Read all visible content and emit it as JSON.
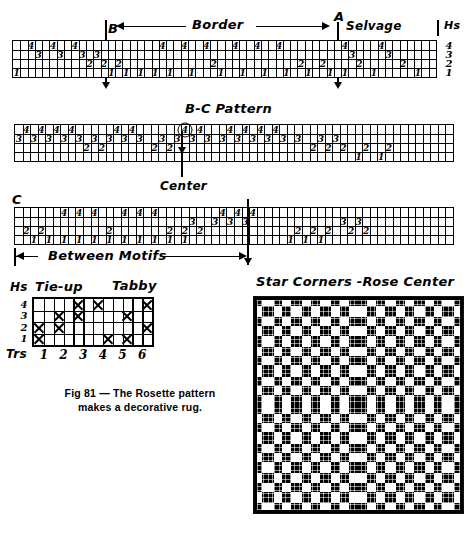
{
  "figure": {
    "caption_line1": "Fig 81 — The Rosette pattern",
    "caption_line2": "makes a decorative rug."
  },
  "draft1": {
    "label_B": "B",
    "label_A": "A",
    "label_border": "Border",
    "label_selvage": "Selvage",
    "label_hs_right": "Hs",
    "harness_labels": [
      "4",
      "3",
      "2",
      "1"
    ],
    "columns": 58,
    "threads": [
      {
        "col": 0,
        "harness": 1
      },
      {
        "col": 2,
        "harness": 4
      },
      {
        "col": 3,
        "harness": 3
      },
      {
        "col": 5,
        "harness": 4
      },
      {
        "col": 6,
        "harness": 3
      },
      {
        "col": 8,
        "harness": 4
      },
      {
        "col": 9,
        "harness": 3
      },
      {
        "col": 10,
        "harness": 2
      },
      {
        "col": 11,
        "harness": 3
      },
      {
        "col": 12,
        "harness": 2
      },
      {
        "col": 13,
        "harness": 1
      },
      {
        "col": 14,
        "harness": 2
      },
      {
        "col": 15,
        "harness": 1
      },
      {
        "col": 17,
        "harness": 1
      },
      {
        "col": 19,
        "harness": 1
      },
      {
        "col": 20,
        "harness": 4
      },
      {
        "col": 21,
        "harness": 1
      },
      {
        "col": 23,
        "harness": 4
      },
      {
        "col": 24,
        "harness": 1
      },
      {
        "col": 26,
        "harness": 4
      },
      {
        "col": 27,
        "harness": 2
      },
      {
        "col": 28,
        "harness": 1
      },
      {
        "col": 30,
        "harness": 4
      },
      {
        "col": 31,
        "harness": 1
      },
      {
        "col": 33,
        "harness": 4
      },
      {
        "col": 34,
        "harness": 1
      },
      {
        "col": 36,
        "harness": 4
      },
      {
        "col": 37,
        "harness": 1
      },
      {
        "col": 39,
        "harness": 2
      },
      {
        "col": 40,
        "harness": 1
      },
      {
        "col": 42,
        "harness": 2
      },
      {
        "col": 43,
        "harness": 1
      },
      {
        "col": 45,
        "harness": 4
      },
      {
        "col": 45,
        "harness": 1
      },
      {
        "col": 46,
        "harness": 3
      },
      {
        "col": 47,
        "harness": 2
      },
      {
        "col": 49,
        "harness": 1
      },
      {
        "col": 50,
        "harness": 4
      },
      {
        "col": 51,
        "harness": 3
      },
      {
        "col": 53,
        "harness": 2
      },
      {
        "col": 55,
        "harness": 1
      }
    ]
  },
  "draft2": {
    "title": "B-C Pattern",
    "label_center": "Center",
    "columns": 58,
    "center_circle_harness": 4,
    "center_circle_col": 22,
    "threads": [
      {
        "col": 0,
        "harness": 3
      },
      {
        "col": 1,
        "harness": 4
      },
      {
        "col": 2,
        "harness": 3
      },
      {
        "col": 3,
        "harness": 4
      },
      {
        "col": 4,
        "harness": 3
      },
      {
        "col": 5,
        "harness": 4
      },
      {
        "col": 6,
        "harness": 3
      },
      {
        "col": 7,
        "harness": 4
      },
      {
        "col": 8,
        "harness": 3
      },
      {
        "col": 9,
        "harness": 2
      },
      {
        "col": 10,
        "harness": 3
      },
      {
        "col": 11,
        "harness": 2
      },
      {
        "col": 12,
        "harness": 3
      },
      {
        "col": 13,
        "harness": 4
      },
      {
        "col": 14,
        "harness": 3
      },
      {
        "col": 15,
        "harness": 4
      },
      {
        "col": 16,
        "harness": 3
      },
      {
        "col": 18,
        "harness": 2
      },
      {
        "col": 19,
        "harness": 3
      },
      {
        "col": 20,
        "harness": 2
      },
      {
        "col": 21,
        "harness": 3
      },
      {
        "col": 22,
        "harness": 4
      },
      {
        "col": 23,
        "harness": 3
      },
      {
        "col": 24,
        "harness": 4
      },
      {
        "col": 25,
        "harness": 3
      },
      {
        "col": 27,
        "harness": 3
      },
      {
        "col": 28,
        "harness": 4
      },
      {
        "col": 29,
        "harness": 3
      },
      {
        "col": 30,
        "harness": 4
      },
      {
        "col": 31,
        "harness": 3
      },
      {
        "col": 32,
        "harness": 4
      },
      {
        "col": 33,
        "harness": 3
      },
      {
        "col": 34,
        "harness": 4
      },
      {
        "col": 35,
        "harness": 3
      },
      {
        "col": 37,
        "harness": 3
      },
      {
        "col": 39,
        "harness": 2
      },
      {
        "col": 40,
        "harness": 3
      },
      {
        "col": 41,
        "harness": 2
      },
      {
        "col": 42,
        "harness": 3
      },
      {
        "col": 43,
        "harness": 2
      },
      {
        "col": 45,
        "harness": 1
      },
      {
        "col": 46,
        "harness": 2
      },
      {
        "col": 48,
        "harness": 1
      },
      {
        "col": 49,
        "harness": 2
      }
    ]
  },
  "draft3": {
    "label_C": "C",
    "label_center_mark": "Center",
    "label_between_motifs": "Between Motifs",
    "columns": 58,
    "threads": [
      {
        "col": 1,
        "harness": 2
      },
      {
        "col": 2,
        "harness": 1
      },
      {
        "col": 3,
        "harness": 2
      },
      {
        "col": 4,
        "harness": 1
      },
      {
        "col": 6,
        "harness": 4
      },
      {
        "col": 6,
        "harness": 1
      },
      {
        "col": 8,
        "harness": 4
      },
      {
        "col": 8,
        "harness": 1
      },
      {
        "col": 10,
        "harness": 4
      },
      {
        "col": 10,
        "harness": 1
      },
      {
        "col": 12,
        "harness": 2
      },
      {
        "col": 12,
        "harness": 1
      },
      {
        "col": 14,
        "harness": 4
      },
      {
        "col": 14,
        "harness": 1
      },
      {
        "col": 16,
        "harness": 4
      },
      {
        "col": 16,
        "harness": 1
      },
      {
        "col": 18,
        "harness": 4
      },
      {
        "col": 18,
        "harness": 1
      },
      {
        "col": 20,
        "harness": 2
      },
      {
        "col": 20,
        "harness": 1
      },
      {
        "col": 22,
        "harness": 2
      },
      {
        "col": 22,
        "harness": 1
      },
      {
        "col": 23,
        "harness": 3
      },
      {
        "col": 24,
        "harness": 2
      },
      {
        "col": 26,
        "harness": 3
      },
      {
        "col": 27,
        "harness": 4
      },
      {
        "col": 28,
        "harness": 3
      },
      {
        "col": 29,
        "harness": 4
      },
      {
        "col": 30,
        "harness": 3
      },
      {
        "col": 31,
        "harness": 4
      },
      {
        "col": 36,
        "harness": 1
      },
      {
        "col": 37,
        "harness": 2
      },
      {
        "col": 38,
        "harness": 1
      },
      {
        "col": 39,
        "harness": 2
      },
      {
        "col": 40,
        "harness": 1
      },
      {
        "col": 41,
        "harness": 2
      },
      {
        "col": 43,
        "harness": 3
      },
      {
        "col": 44,
        "harness": 2
      },
      {
        "col": 45,
        "harness": 3
      },
      {
        "col": 46,
        "harness": 2
      }
    ]
  },
  "tieup": {
    "label_hs": "Hs",
    "title_tieup": "Tie-up",
    "title_tabby": "Tabby",
    "row_labels": [
      "4",
      "3",
      "2",
      "1"
    ],
    "treadle_prefix": "Trs",
    "treadle_labels": [
      "1",
      "2",
      "3",
      "4",
      "5",
      "6"
    ],
    "columns": 12,
    "rows": 4,
    "marks": [
      {
        "col": 0,
        "row": 2
      },
      {
        "col": 0,
        "row": 1
      },
      {
        "col": 2,
        "row": 3
      },
      {
        "col": 2,
        "row": 2
      },
      {
        "col": 4,
        "row": 4
      },
      {
        "col": 4,
        "row": 3
      },
      {
        "col": 6,
        "row": 4
      },
      {
        "col": 7,
        "row": 1
      },
      {
        "col": 9,
        "row": 3
      },
      {
        "col": 9,
        "row": 1
      },
      {
        "col": 11,
        "row": 4
      },
      {
        "col": 11,
        "row": 2
      }
    ]
  },
  "drawdown": {
    "title": "Star Corners -Rose Center"
  },
  "colors": {
    "ink": "#000000",
    "paper": "#ffffff"
  }
}
